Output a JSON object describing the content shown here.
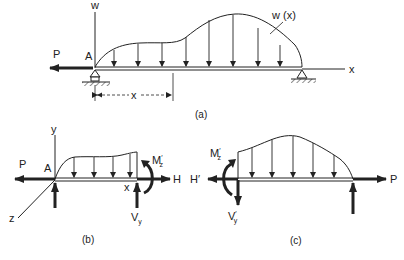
{
  "figure_a": {
    "caption": "(a)",
    "axis_w": "w",
    "axis_x": "x",
    "load_label": "w (x)",
    "force_P": "P",
    "point_A": "A",
    "dimension_x": "x"
  },
  "figure_b": {
    "caption": "(b)",
    "axis_y": "y",
    "axis_z": "z",
    "force_P": "P",
    "point_A": "A",
    "section_x": "x",
    "force_H": "H",
    "moment_M": "M",
    "moment_M_sub": "z",
    "moment_M_prime": "′",
    "shear_V": "V",
    "shear_V_sub": "y"
  },
  "figure_c": {
    "caption": "(c)",
    "force_H_prime": "H′",
    "force_P": "P",
    "moment_M": "M",
    "moment_M_sub": "z",
    "moment_M_prime": "′",
    "shear_V": "V",
    "shear_V_sub": "y",
    "shear_V_prime": "′"
  },
  "colors": {
    "ink": "#222222",
    "background": "#ffffff"
  }
}
